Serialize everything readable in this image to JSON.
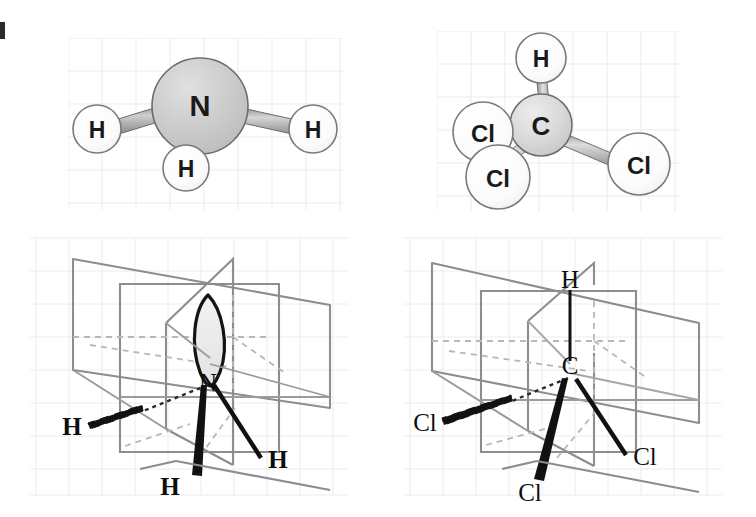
{
  "figure": {
    "edge_mark_label": "4",
    "background_color": "#ffffff",
    "grid_color": "#e9e9e9",
    "panels": [
      {
        "id": "ammonia-ball-and-stick",
        "name": "Ammonia NH3 ball-and-stick model",
        "central_atom": "N",
        "terminal_atoms": [
          "H",
          "H",
          "H"
        ],
        "center_sphere_color": "#c9c9c9",
        "terminal_sphere_color": "#fafafa",
        "bond_color": "#9a9a9a"
      },
      {
        "id": "chloroform-ball-and-stick",
        "name": "Chloroform CHCl3 ball-and-stick model",
        "central_atom": "C",
        "terminal_atoms": [
          "H",
          "Cl",
          "Cl",
          "Cl"
        ],
        "center_sphere_color": "#d4d4d4",
        "terminal_sphere_color": "#fafafa",
        "bond_color": "#9a9a9a"
      },
      {
        "id": "ammonia-mirror-planes",
        "name": "Ammonia with three mirror planes",
        "central_atom": "N",
        "terminal_atoms": [
          "H",
          "H",
          "H"
        ],
        "lone_pair": true,
        "plane_color": "#8c8c8c",
        "bond_color": "#121212"
      },
      {
        "id": "chloroform-mirror-planes",
        "name": "Chloroform with three mirror planes",
        "central_atom": "C",
        "terminal_atoms": [
          "H",
          "Cl",
          "Cl",
          "Cl"
        ],
        "lone_pair": false,
        "plane_color": "#8c8c8c",
        "bond_color": "#121212"
      }
    ]
  },
  "labels": {
    "nh3_model": {
      "center": "N",
      "h_left": "H",
      "h_right": "H",
      "h_bottom": "H"
    },
    "chcl3_model": {
      "center": "C",
      "h_top": "H",
      "cl_left": "Cl",
      "cl_lower_left": "Cl",
      "cl_right": "Cl"
    },
    "nh3_planes": {
      "center": "N",
      "h_left": "H",
      "h_front": "H",
      "h_right": "H"
    },
    "chcl3_planes": {
      "center": "C",
      "h_top": "H",
      "cl_left": "Cl",
      "cl_front": "Cl",
      "cl_right": "Cl"
    }
  }
}
